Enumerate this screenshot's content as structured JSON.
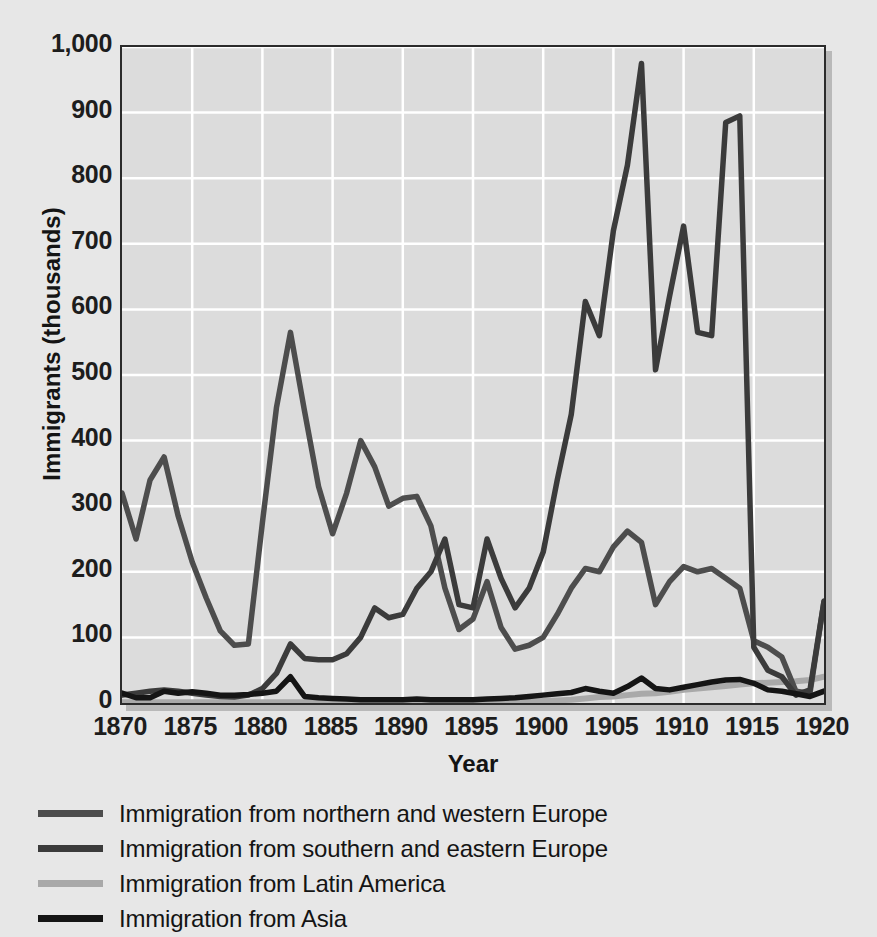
{
  "chart_data": {
    "type": "line",
    "title": "",
    "xlabel": "Year",
    "ylabel": "Immigrants (thousands)",
    "xlim": [
      1870,
      1920
    ],
    "ylim": [
      0,
      1000
    ],
    "grid": true,
    "legend_position": "below",
    "xticks": [
      "1870",
      "1875",
      "1880",
      "1885",
      "1890",
      "1895",
      "1900",
      "1905",
      "1910",
      "1915",
      "1920"
    ],
    "yticks": [
      "0",
      "100",
      "200",
      "300",
      "400",
      "500",
      "600",
      "700",
      "800",
      "900",
      "1,000"
    ],
    "x": [
      1870,
      1871,
      1872,
      1873,
      1874,
      1875,
      1876,
      1877,
      1878,
      1879,
      1880,
      1881,
      1882,
      1883,
      1884,
      1885,
      1886,
      1887,
      1888,
      1889,
      1890,
      1891,
      1892,
      1893,
      1894,
      1895,
      1896,
      1897,
      1898,
      1899,
      1900,
      1901,
      1902,
      1903,
      1904,
      1905,
      1906,
      1907,
      1908,
      1909,
      1910,
      1911,
      1912,
      1913,
      1914,
      1915,
      1916,
      1917,
      1918,
      1919,
      1920
    ],
    "series": [
      {
        "name": "Immigration from northern and western Europe",
        "color": "#4d4d4d",
        "values": [
          320,
          250,
          340,
          375,
          285,
          215,
          160,
          110,
          88,
          90,
          275,
          450,
          565,
          445,
          330,
          258,
          320,
          400,
          360,
          300,
          312,
          315,
          270,
          175,
          112,
          128,
          185,
          115,
          82,
          88,
          100,
          135,
          175,
          205,
          200,
          238,
          262,
          245,
          150,
          185,
          208,
          200,
          205,
          190,
          175,
          95,
          85,
          70,
          18,
          15,
          155
        ],
        "note": "Values read from the chart; units thousands."
      },
      {
        "name": "Immigration from southern and eastern Europe",
        "color": "#3b3b3b",
        "values": [
          12,
          15,
          18,
          20,
          18,
          15,
          12,
          10,
          9,
          12,
          22,
          45,
          90,
          68,
          66,
          66,
          75,
          100,
          145,
          130,
          135,
          175,
          200,
          250,
          150,
          145,
          250,
          190,
          145,
          175,
          230,
          340,
          440,
          612,
          560,
          720,
          820,
          975,
          508,
          620,
          727,
          565,
          560,
          885,
          895,
          85,
          50,
          40,
          12,
          20,
          155
        ]
      },
      {
        "name": "Immigration from Latin America",
        "color": "#a9a9a9",
        "values": [
          1,
          1,
          1,
          1,
          1,
          1,
          1,
          1,
          1,
          1,
          1,
          1,
          1,
          1,
          1,
          1,
          1,
          1,
          2,
          2,
          2,
          2,
          2,
          2,
          2,
          2,
          2,
          2,
          2,
          2,
          3,
          4,
          5,
          7,
          9,
          10,
          12,
          14,
          15,
          17,
          20,
          22,
          24,
          26,
          28,
          30,
          31,
          32,
          33,
          35,
          40
        ]
      },
      {
        "name": "Immigration from Asia",
        "color": "#151515",
        "values": [
          15,
          8,
          8,
          18,
          15,
          17,
          15,
          12,
          12,
          13,
          15,
          18,
          40,
          10,
          8,
          7,
          6,
          5,
          5,
          5,
          5,
          6,
          5,
          5,
          5,
          5,
          6,
          7,
          8,
          10,
          12,
          14,
          16,
          22,
          18,
          15,
          25,
          38,
          22,
          20,
          24,
          28,
          32,
          35,
          36,
          30,
          20,
          18,
          14,
          10,
          18
        ]
      }
    ]
  },
  "axes": {
    "ylabel": "Immigrants (thousands)",
    "xlabel": "Year"
  },
  "legend": {
    "items": [
      {
        "label": "Immigration from northern and western Europe",
        "color": "#4d4d4d"
      },
      {
        "label": "Immigration from southern and eastern Europe",
        "color": "#3b3b3b"
      },
      {
        "label": "Immigration from Latin America",
        "color": "#a9a9a9"
      },
      {
        "label": "Immigration from Asia",
        "color": "#151515"
      }
    ]
  }
}
